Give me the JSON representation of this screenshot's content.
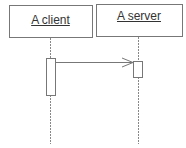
{
  "diagram": {
    "type": "sequence",
    "participants": [
      {
        "name": "A client",
        "box": {
          "x": 9,
          "y": 5,
          "w": 83,
          "h": 32
        },
        "lifeline_x": 50
      },
      {
        "name": "A server",
        "box": {
          "x": 96,
          "y": 4,
          "w": 86,
          "h": 32
        },
        "lifeline_x": 138
      }
    ],
    "activations": [
      {
        "participant": "A client",
        "x": 46,
        "y": 58,
        "w": 9,
        "h": 37
      },
      {
        "participant": "A server",
        "x": 133,
        "y": 61,
        "w": 9,
        "h": 16
      }
    ],
    "messages": [
      {
        "from": "A client",
        "to": "A server",
        "y": 62,
        "label": "",
        "arrow": "open"
      }
    ],
    "colors": {
      "stroke": "#666666",
      "text": "#333333",
      "lifeline": "#888888"
    }
  }
}
